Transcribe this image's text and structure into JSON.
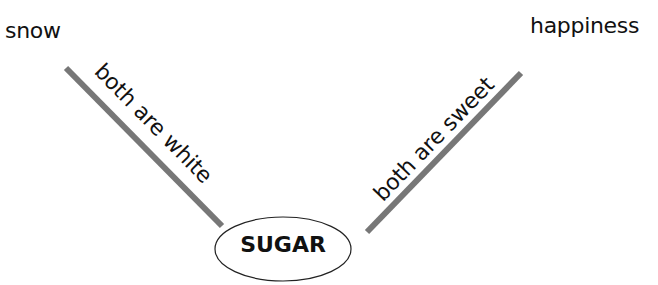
{
  "diagram": {
    "top_left_concept": "snow",
    "top_right_concept": "happiness",
    "center_concept": "SUGAR",
    "left_link_label": "both are white",
    "right_link_label": "both are sweet",
    "colors": {
      "line": "#777777",
      "text": "#111111",
      "ellipse_stroke": "#222222"
    }
  }
}
